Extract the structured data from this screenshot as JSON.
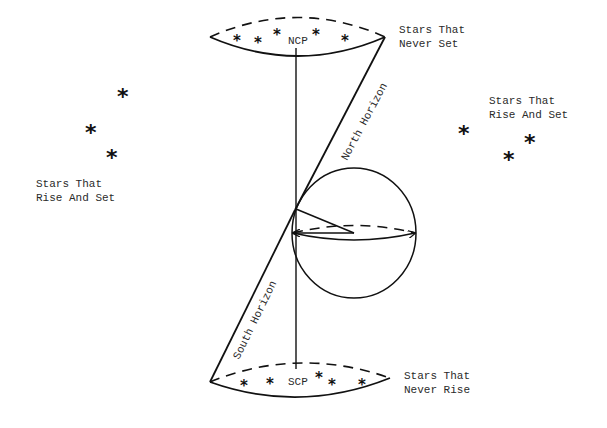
{
  "diagram": {
    "type": "celestial-sphere-horizon-diagram",
    "colors": {
      "ink": "#111111",
      "text": "#2a2a2a",
      "background": "#ffffff"
    },
    "poles": {
      "north": {
        "label": "NCP"
      },
      "south": {
        "label": "SCP"
      }
    },
    "horizons": {
      "north": {
        "label": "North Horizon"
      },
      "south": {
        "label": "South Horizon"
      }
    },
    "regions": {
      "never_set": {
        "line1": "Stars That",
        "line2": "Never Set"
      },
      "never_rise": {
        "line1": "Stars That",
        "line2": "Never Rise"
      },
      "rise_set_left": {
        "line1": "Stars That",
        "line2": "Rise And Set"
      },
      "rise_set_right": {
        "line1": "Stars That",
        "line2": "Rise And Set"
      }
    },
    "star_glyph": "*"
  }
}
